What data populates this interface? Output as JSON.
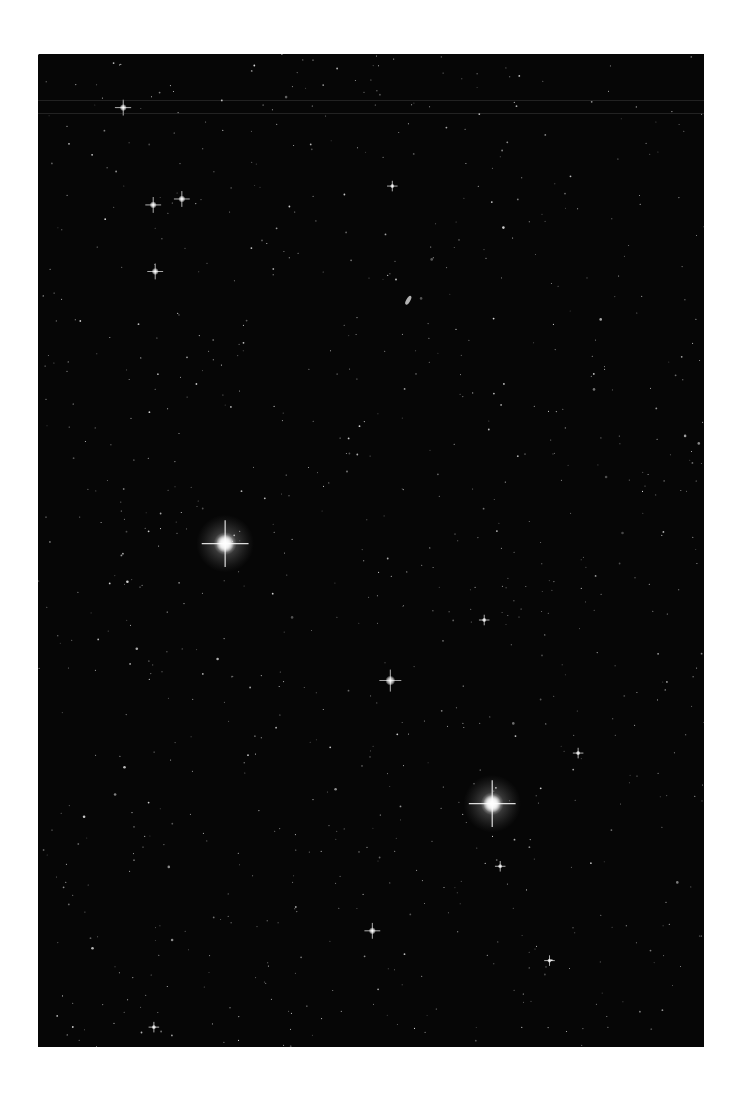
{
  "image": {
    "subject": "Star field photograph",
    "background_color": "#060606",
    "page_color": "#ffffff",
    "star_color": "#ffffff"
  },
  "bright_stars": [
    {
      "name": "bright-star-left",
      "x": 0.281,
      "y": 0.493,
      "magnitude": "very-bright",
      "halo": true
    },
    {
      "name": "bright-star-lower-right",
      "x": 0.682,
      "y": 0.755,
      "magnitude": "very-bright",
      "halo": true
    },
    {
      "name": "star-center",
      "x": 0.529,
      "y": 0.631,
      "magnitude": "bright",
      "halo": false
    },
    {
      "name": "star-upper-left-1",
      "x": 0.128,
      "y": 0.054,
      "magnitude": "medium",
      "halo": false
    },
    {
      "name": "star-upper-left-2",
      "x": 0.173,
      "y": 0.152,
      "magnitude": "medium",
      "halo": false
    },
    {
      "name": "star-upper-left-3",
      "x": 0.216,
      "y": 0.146,
      "magnitude": "medium",
      "halo": false
    },
    {
      "name": "star-upper-left-4",
      "x": 0.176,
      "y": 0.219,
      "magnitude": "medium",
      "halo": false
    },
    {
      "name": "star-upper-center",
      "x": 0.532,
      "y": 0.133,
      "magnitude": "small",
      "halo": false
    },
    {
      "name": "star-mid-right",
      "x": 0.67,
      "y": 0.57,
      "magnitude": "small",
      "halo": false
    },
    {
      "name": "star-right",
      "x": 0.811,
      "y": 0.704,
      "magnitude": "small",
      "halo": false
    },
    {
      "name": "star-lower-right",
      "x": 0.694,
      "y": 0.818,
      "magnitude": "small",
      "halo": false
    },
    {
      "name": "star-lower-center",
      "x": 0.502,
      "y": 0.883,
      "magnitude": "medium",
      "halo": false
    },
    {
      "name": "star-lower-right-2",
      "x": 0.768,
      "y": 0.913,
      "magnitude": "small",
      "halo": false
    },
    {
      "name": "star-bottom-left",
      "x": 0.174,
      "y": 0.98,
      "magnitude": "small",
      "halo": false
    }
  ],
  "faint_star_count": 900,
  "galaxy": {
    "name": "small-galaxy",
    "x": 0.556,
    "y": 0.248
  }
}
